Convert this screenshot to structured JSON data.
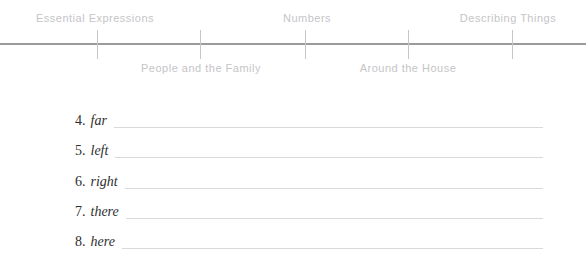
{
  "timeline": {
    "top_labels": [
      {
        "label": "Essential Expressions"
      },
      {
        "label": "Numbers"
      },
      {
        "label": "Describing Things"
      }
    ],
    "bottom_labels": [
      {
        "label": "People and the Family"
      },
      {
        "label": "Around the House"
      }
    ]
  },
  "worksheet": {
    "items": [
      {
        "number": "4.",
        "word": "far",
        "answer": ""
      },
      {
        "number": "5.",
        "word": "left",
        "answer": ""
      },
      {
        "number": "6.",
        "word": "right",
        "answer": ""
      },
      {
        "number": "7.",
        "word": "there",
        "answer": ""
      },
      {
        "number": "8.",
        "word": "here",
        "answer": ""
      }
    ]
  },
  "colors": {
    "timeline_line": "#9a9a9a",
    "tick": "#c7c7c7",
    "nav_label": "#c5c5c8",
    "list_text": "#2e2e2e",
    "blank_line": "#d9d9d9"
  }
}
